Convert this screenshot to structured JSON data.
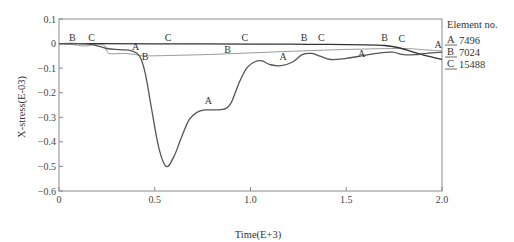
{
  "chart_data": {
    "type": "line",
    "title": "",
    "xlabel": "Time(E+3)",
    "ylabel": "X-stress(E-03)",
    "xlim": [
      0,
      2.0
    ],
    "ylim": [
      -0.6,
      0.1
    ],
    "xticks": [
      0,
      0.5,
      1.0,
      1.5,
      2.0
    ],
    "xtick_labels": [
      "0",
      "0.5",
      "1.0",
      "1.5",
      "2.0"
    ],
    "yticks": [
      0.1,
      0,
      -0.1,
      -0.2,
      -0.3,
      -0.4,
      -0.5,
      -0.6
    ],
    "ytick_labels": [
      "0.1",
      "0",
      "−0.1",
      "−0.2",
      "−0.3",
      "−0.4",
      "−0.5",
      "−0.6"
    ],
    "grid": false,
    "legend": {
      "title": "Element no.",
      "position": "right",
      "entries": [
        {
          "marker": "A",
          "label": "7496"
        },
        {
          "marker": "B",
          "label": "7024"
        },
        {
          "marker": "C",
          "label": "15488"
        }
      ]
    },
    "series": [
      {
        "name": "A",
        "element": "7496",
        "color": "#555555",
        "x": [
          0,
          0.1,
          0.18,
          0.25,
          0.32,
          0.38,
          0.42,
          0.45,
          0.48,
          0.52,
          0.56,
          0.6,
          0.64,
          0.68,
          0.72,
          0.76,
          0.82,
          0.87,
          0.9,
          0.94,
          0.98,
          1.02,
          1.06,
          1.1,
          1.16,
          1.22,
          1.27,
          1.32,
          1.36,
          1.42,
          1.5,
          1.58,
          1.66,
          1.74,
          1.8,
          1.86,
          1.92,
          2.0
        ],
        "y": [
          0,
          0,
          -0.005,
          -0.02,
          -0.025,
          -0.03,
          -0.05,
          -0.12,
          -0.25,
          -0.42,
          -0.5,
          -0.46,
          -0.38,
          -0.31,
          -0.28,
          -0.27,
          -0.27,
          -0.265,
          -0.24,
          -0.16,
          -0.1,
          -0.075,
          -0.07,
          -0.085,
          -0.09,
          -0.075,
          -0.045,
          -0.04,
          -0.05,
          -0.065,
          -0.06,
          -0.05,
          -0.04,
          -0.035,
          -0.045,
          -0.045,
          -0.04,
          -0.035
        ]
      },
      {
        "name": "B",
        "element": "7024",
        "color": "#9a9a9a",
        "x": [
          0,
          0.08,
          0.14,
          0.2,
          0.24,
          0.26,
          0.34,
          0.4,
          0.44,
          0.6,
          0.8,
          1.0,
          1.2,
          1.4,
          1.6,
          1.8,
          1.9,
          2.0
        ],
        "y": [
          0,
          -0.005,
          -0.01,
          -0.002,
          -0.01,
          -0.04,
          -0.04,
          -0.045,
          -0.05,
          -0.048,
          -0.044,
          -0.038,
          -0.032,
          -0.026,
          -0.022,
          -0.02,
          -0.025,
          -0.03
        ]
      },
      {
        "name": "C",
        "element": "15488",
        "color": "#333333",
        "x": [
          0,
          0.2,
          0.5,
          1.0,
          1.3,
          1.6,
          1.7,
          1.78,
          1.85,
          1.92,
          2.0
        ],
        "y": [
          0,
          0,
          -0.001,
          -0.002,
          -0.003,
          -0.005,
          -0.008,
          -0.018,
          -0.035,
          -0.05,
          -0.065
        ]
      }
    ],
    "annotations": [
      {
        "text": "B",
        "x": 0.07,
        "y": 0.012
      },
      {
        "text": "C",
        "x": 0.17,
        "y": 0.012
      },
      {
        "text": "A",
        "x": 0.4,
        "y": -0.025
      },
      {
        "text": "B",
        "x": 0.45,
        "y": -0.065
      },
      {
        "text": "C",
        "x": 0.57,
        "y": 0.012
      },
      {
        "text": "B",
        "x": 0.88,
        "y": -0.04
      },
      {
        "text": "C",
        "x": 0.97,
        "y": 0.012
      },
      {
        "text": "A",
        "x": 0.78,
        "y": -0.245
      },
      {
        "text": "A",
        "x": 1.17,
        "y": -0.065
      },
      {
        "text": "B",
        "x": 1.28,
        "y": 0.012
      },
      {
        "text": "C",
        "x": 1.37,
        "y": 0.012
      },
      {
        "text": "A",
        "x": 1.58,
        "y": -0.055
      },
      {
        "text": "B",
        "x": 1.7,
        "y": 0.012
      },
      {
        "text": "C",
        "x": 1.79,
        "y": 0.005
      },
      {
        "text": "A",
        "x": 1.98,
        "y": -0.02
      }
    ]
  }
}
